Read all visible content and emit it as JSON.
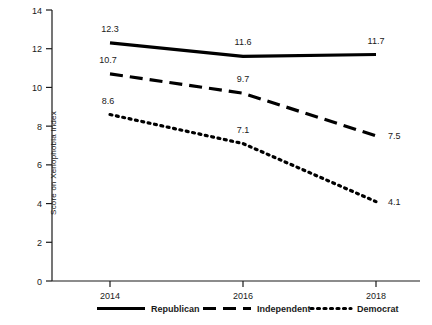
{
  "chart_data": {
    "type": "line",
    "title": "",
    "xlabel": "",
    "ylabel": "Score on Xenophobia Index",
    "categories": [
      "2014",
      "2016",
      "2018"
    ],
    "x_tick_labels": [
      "2014",
      "2016",
      "2018"
    ],
    "y_tick_labels": [
      "0",
      "2",
      "4",
      "6",
      "8",
      "10",
      "12",
      "14"
    ],
    "y_ticks": [
      0,
      2,
      4,
      6,
      8,
      10,
      12,
      14
    ],
    "ylim": [
      0,
      14
    ],
    "grid": false,
    "legend_position": "bottom",
    "series": [
      {
        "name": "Republican",
        "style": "solid",
        "color": "#000000",
        "values": [
          12.3,
          11.6,
          11.7
        ],
        "labels": [
          "12.3",
          "11.6",
          "11.7"
        ]
      },
      {
        "name": "Independent",
        "style": "dashed",
        "color": "#000000",
        "values": [
          10.7,
          9.7,
          7.5
        ],
        "labels": [
          "10.7",
          "9.7",
          "7.5"
        ]
      },
      {
        "name": "Democrat",
        "style": "dotted",
        "color": "#000000",
        "values": [
          8.6,
          7.1,
          4.1
        ],
        "labels": [
          "8.6",
          "7.1",
          "4.1"
        ]
      }
    ]
  },
  "axis": {
    "y_title": "Score on Xenophobia Index"
  },
  "legend": {
    "items": [
      {
        "label": "Republican"
      },
      {
        "label": "Independent"
      },
      {
        "label": "Democrat"
      }
    ]
  }
}
